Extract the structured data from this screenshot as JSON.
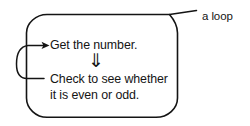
{
  "figure": {
    "kind": "flowchart-loop-illustration",
    "background_color": "#ffffff",
    "ink_color": "#141414",
    "annotation": {
      "label": "a loop",
      "leader_line": "diagonal leader from loop top-right corner to label"
    },
    "steps": [
      {
        "id": "get-number",
        "text": "Get the number."
      },
      {
        "id": "check-even-odd",
        "line1": "Check to see whether",
        "line2": "it is even or odd."
      }
    ],
    "connectors": {
      "flow_down_glyph": "⇓",
      "flow_down_name": "double-down-arrow",
      "loop_back_name": "loop-back-arrow",
      "loop_back_direction": "from check step back up into get-number step"
    }
  }
}
